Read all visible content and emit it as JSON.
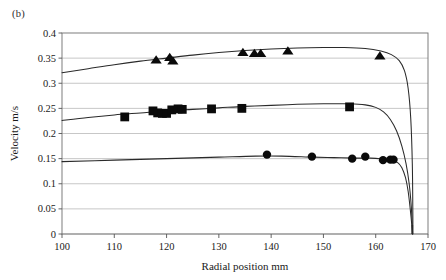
{
  "figure": {
    "panel_label": "(b)",
    "background_color": "#ffffff",
    "marker_color": "#0a0a0a",
    "grid_color": "#b9b9b9",
    "frame_color": "#6f6f6f"
  },
  "chart_data": {
    "type": "scatter",
    "title": "",
    "panel": "(b)",
    "xlabel": "Radial position mm",
    "ylabel": "Velocity m/s",
    "xlim": [
      100,
      170
    ],
    "ylim": [
      0,
      0.4
    ],
    "xticks": [
      100,
      110,
      120,
      130,
      140,
      150,
      160,
      170
    ],
    "xtick_labels": [
      "100",
      "110",
      "120",
      "130",
      "140",
      "150",
      "160",
      "170"
    ],
    "yticks": [
      0,
      0.05,
      0.1,
      0.15,
      0.2,
      0.25,
      0.3,
      0.35,
      0.4
    ],
    "ytick_labels": [
      "0",
      "0.05",
      "0.1",
      "0.15",
      "0.2",
      "0.25",
      "0.3",
      "0.35",
      "0.4"
    ],
    "grid": "horizontal",
    "legend": "none",
    "extra_xtick": 167,
    "annotations": [
      "All three fitted curves drop steeply to zero velocity at the wall, near radial position 167 mm"
    ],
    "series": [
      {
        "name": "Upper velocity profile",
        "marker": "triangle",
        "marker_size": 5.2,
        "points": [
          {
            "x": 118.0,
            "y": 0.347
          },
          {
            "x": 120.6,
            "y": 0.352
          },
          {
            "x": 121.2,
            "y": 0.345
          },
          {
            "x": 134.6,
            "y": 0.362
          },
          {
            "x": 136.8,
            "y": 0.36
          },
          {
            "x": 138.0,
            "y": 0.36
          },
          {
            "x": 143.2,
            "y": 0.365
          },
          {
            "x": 160.8,
            "y": 0.355
          }
        ],
        "fit_curve": [
          {
            "x": 100.0,
            "y": 0.321
          },
          {
            "x": 105.0,
            "y": 0.329
          },
          {
            "x": 110.0,
            "y": 0.337
          },
          {
            "x": 115.0,
            "y": 0.344
          },
          {
            "x": 120.0,
            "y": 0.35
          },
          {
            "x": 125.0,
            "y": 0.356
          },
          {
            "x": 130.0,
            "y": 0.361
          },
          {
            "x": 135.0,
            "y": 0.365
          },
          {
            "x": 140.0,
            "y": 0.368
          },
          {
            "x": 145.0,
            "y": 0.37
          },
          {
            "x": 150.0,
            "y": 0.371
          },
          {
            "x": 154.0,
            "y": 0.371
          },
          {
            "x": 158.0,
            "y": 0.369
          },
          {
            "x": 161.0,
            "y": 0.364
          },
          {
            "x": 163.0,
            "y": 0.357
          },
          {
            "x": 164.5,
            "y": 0.345
          },
          {
            "x": 165.5,
            "y": 0.325
          },
          {
            "x": 166.2,
            "y": 0.29
          },
          {
            "x": 166.7,
            "y": 0.23
          },
          {
            "x": 167.0,
            "y": 0.14
          },
          {
            "x": 167.1,
            "y": 0.04
          },
          {
            "x": 167.1,
            "y": 0.0
          }
        ]
      },
      {
        "name": "Middle velocity profile",
        "marker": "square",
        "marker_size": 4.4,
        "points": [
          {
            "x": 112.0,
            "y": 0.233
          },
          {
            "x": 117.4,
            "y": 0.245
          },
          {
            "x": 118.3,
            "y": 0.241
          },
          {
            "x": 119.2,
            "y": 0.24
          },
          {
            "x": 120.0,
            "y": 0.24
          },
          {
            "x": 121.0,
            "y": 0.247
          },
          {
            "x": 122.2,
            "y": 0.249
          },
          {
            "x": 123.0,
            "y": 0.248
          },
          {
            "x": 128.6,
            "y": 0.249
          },
          {
            "x": 134.4,
            "y": 0.25
          },
          {
            "x": 155.0,
            "y": 0.253
          }
        ],
        "fit_curve": [
          {
            "x": 100.0,
            "y": 0.226
          },
          {
            "x": 105.0,
            "y": 0.232
          },
          {
            "x": 110.0,
            "y": 0.237
          },
          {
            "x": 115.0,
            "y": 0.241
          },
          {
            "x": 120.0,
            "y": 0.245
          },
          {
            "x": 125.0,
            "y": 0.248
          },
          {
            "x": 130.0,
            "y": 0.251
          },
          {
            "x": 135.0,
            "y": 0.254
          },
          {
            "x": 140.0,
            "y": 0.256
          },
          {
            "x": 145.0,
            "y": 0.258
          },
          {
            "x": 150.0,
            "y": 0.259
          },
          {
            "x": 155.0,
            "y": 0.259
          },
          {
            "x": 158.0,
            "y": 0.257
          },
          {
            "x": 160.0,
            "y": 0.252
          },
          {
            "x": 161.5,
            "y": 0.243
          },
          {
            "x": 162.8,
            "y": 0.228
          },
          {
            "x": 164.0,
            "y": 0.205
          },
          {
            "x": 165.0,
            "y": 0.175
          },
          {
            "x": 165.8,
            "y": 0.14
          },
          {
            "x": 166.4,
            "y": 0.1
          },
          {
            "x": 166.8,
            "y": 0.055
          },
          {
            "x": 167.0,
            "y": 0.015
          },
          {
            "x": 167.05,
            "y": 0.0
          }
        ]
      },
      {
        "name": "Lower velocity profile",
        "marker": "circle",
        "marker_size": 4.2,
        "points": [
          {
            "x": 139.2,
            "y": 0.158
          },
          {
            "x": 147.8,
            "y": 0.154
          },
          {
            "x": 155.5,
            "y": 0.15
          },
          {
            "x": 158.0,
            "y": 0.154
          },
          {
            "x": 161.4,
            "y": 0.147
          },
          {
            "x": 162.8,
            "y": 0.148
          },
          {
            "x": 163.4,
            "y": 0.148
          }
        ],
        "fit_curve": [
          {
            "x": 100.0,
            "y": 0.144
          },
          {
            "x": 110.0,
            "y": 0.147
          },
          {
            "x": 120.0,
            "y": 0.15
          },
          {
            "x": 130.0,
            "y": 0.153
          },
          {
            "x": 137.0,
            "y": 0.155
          },
          {
            "x": 142.0,
            "y": 0.155
          },
          {
            "x": 148.0,
            "y": 0.153
          },
          {
            "x": 152.0,
            "y": 0.152
          },
          {
            "x": 156.0,
            "y": 0.151
          },
          {
            "x": 159.0,
            "y": 0.151
          },
          {
            "x": 161.5,
            "y": 0.149
          },
          {
            "x": 163.0,
            "y": 0.147
          },
          {
            "x": 164.2,
            "y": 0.142
          },
          {
            "x": 165.0,
            "y": 0.132
          },
          {
            "x": 165.7,
            "y": 0.112
          },
          {
            "x": 166.2,
            "y": 0.085
          },
          {
            "x": 166.6,
            "y": 0.05
          },
          {
            "x": 166.9,
            "y": 0.018
          },
          {
            "x": 167.0,
            "y": 0.0
          }
        ]
      }
    ]
  }
}
